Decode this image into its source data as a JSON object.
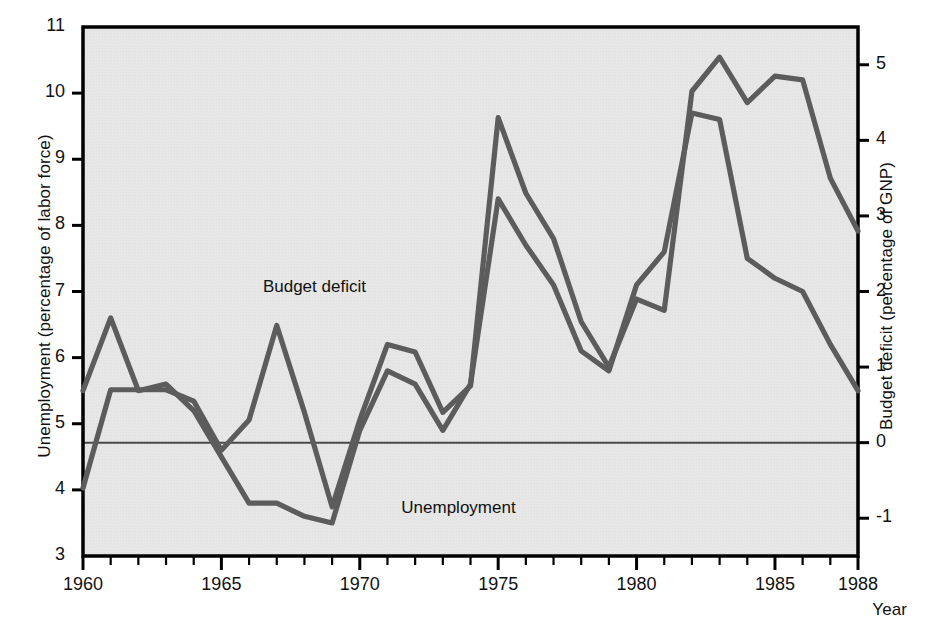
{
  "chart_data": {
    "type": "line",
    "title": "",
    "xlabel": "Year",
    "ylabel": "Unemployment (percentage of labor force)",
    "ylabel_right": "Budget deficit (percentage of GNP)",
    "xlim": [
      1960,
      1988
    ],
    "ylim": [
      3,
      11
    ],
    "ylim_right": [
      -1.5,
      5.5
    ],
    "grid": false,
    "legend_position": "inline-annotations",
    "x_tick_labels": [
      "1960",
      "1965",
      "1970",
      "1975",
      "1980",
      "1985",
      "1988"
    ],
    "x_tick_values": [
      1960,
      1965,
      1970,
      1975,
      1980,
      1985,
      1988
    ],
    "x_minor_ticks_every": 1,
    "y_tick_labels_left": [
      "11",
      "10",
      "9",
      "8",
      "7",
      "6",
      "5",
      "4",
      "3"
    ],
    "y_tick_values_left": [
      11,
      10,
      9,
      8,
      7,
      6,
      5,
      4,
      3
    ],
    "y_tick_labels_right": [
      "5",
      "4",
      "3",
      "2",
      "1",
      "0",
      "-1"
    ],
    "y_tick_values_right": [
      5,
      4,
      3,
      2,
      1,
      0,
      -1
    ],
    "zero_reference_line": {
      "right_axis_value": 0,
      "left_axis_value": 5,
      "color": "#4a4a4a"
    },
    "x": [
      1960,
      1961,
      1962,
      1963,
      1964,
      1965,
      1966,
      1967,
      1968,
      1969,
      1970,
      1971,
      1972,
      1973,
      1974,
      1975,
      1976,
      1977,
      1978,
      1979,
      1980,
      1981,
      1982,
      1983,
      1984,
      1985,
      1986,
      1987,
      1988
    ],
    "series": [
      {
        "name": "Unemployment",
        "axis": "left",
        "units": "percentage of labor force",
        "color": "#5c5c5c",
        "label_text": "Unemployment",
        "values": [
          5.5,
          6.6,
          5.5,
          5.6,
          5.2,
          4.5,
          3.8,
          3.8,
          3.6,
          3.5,
          4.9,
          5.8,
          5.6,
          4.9,
          5.6,
          8.4,
          7.7,
          7.1,
          6.1,
          5.8,
          7.1,
          7.6,
          9.7,
          9.6,
          7.5,
          7.2,
          7.0,
          6.2,
          5.5
        ]
      },
      {
        "name": "Budget deficit",
        "axis": "right",
        "units": "percentage of GNP",
        "color": "#5c5c5c",
        "label_text": "Budget deficit",
        "values": [
          -0.6,
          0.7,
          0.7,
          0.7,
          0.55,
          -0.1,
          0.3,
          1.55,
          0.4,
          -0.85,
          0.3,
          1.3,
          1.2,
          0.4,
          0.75,
          4.3,
          3.3,
          2.7,
          1.6,
          1.0,
          1.9,
          1.75,
          4.65,
          5.1,
          4.5,
          4.85,
          4.8,
          3.5,
          2.8
        ]
      }
    ],
    "annotations": [
      {
        "text": "Budget deficit",
        "x_year": 1966.5,
        "y_pixel_top": 277
      },
      {
        "text": "Unemployment",
        "x_year": 1971.5,
        "y_pixel_top": 498
      }
    ],
    "plot_area_px": {
      "left": 83,
      "top": 27,
      "right": 858,
      "bottom": 556
    },
    "background_color": "#e7e7e7",
    "frame_color": "#000000"
  },
  "axes": {
    "left_title": "Unemployment (percentage of labor force)",
    "right_title": "Budget deficit (percentage of GNP)",
    "x_title": "Year"
  }
}
